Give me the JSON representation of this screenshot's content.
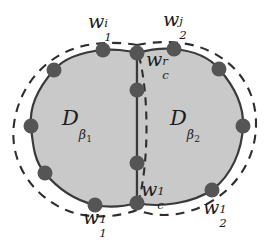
{
  "figure": {
    "background_color": "#ffffff",
    "fill_color": "#c9c9c9",
    "outline_color": "#3a3a3a",
    "dashed_color": "#2e2e2e",
    "dot_color": "#555555",
    "text_color": "#1c1c1c",
    "width": 269,
    "height": 244
  },
  "labels": {
    "top_left": {
      "base": "w",
      "sub": "1",
      "sup": "i",
      "x": 88,
      "y": 12
    },
    "top_right": {
      "base": "w",
      "sub": "2",
      "sup": "j",
      "x": 163,
      "y": 10
    },
    "center_top": {
      "base": "w",
      "sub": "c",
      "sup": "r",
      "x": 146,
      "y": 50
    },
    "center_bottom": {
      "base": "w",
      "sub": "c",
      "sup": "1",
      "x": 141,
      "y": 180
    },
    "bottom_left": {
      "base": "w",
      "sub": "1",
      "sup": "1",
      "x": 83,
      "y": 208
    },
    "bottom_right": {
      "base": "w",
      "sub": "2",
      "sup": "1",
      "x": 203,
      "y": 198
    }
  },
  "regions": {
    "left": {
      "symbol": "D",
      "beta": "β",
      "index": "1",
      "x": 62,
      "y": 108
    },
    "right": {
      "symbol": "D",
      "beta": "β",
      "index": "2",
      "x": 170,
      "y": 108
    }
  },
  "geometry": {
    "left_lobe_center_x": 83,
    "right_lobe_center_x": 172,
    "lobe_center_y": 124,
    "lobe_radius_x": 72,
    "lobe_radius_y": 75,
    "divider_x": 137,
    "dashed_offset": 7
  },
  "boundary_dots": [
    {
      "name": "dot-left-top-outer",
      "x": 103,
      "y": 50
    },
    {
      "name": "dot-left-upper",
      "x": 54,
      "y": 70
    },
    {
      "name": "dot-left-mid",
      "x": 31,
      "y": 126
    },
    {
      "name": "dot-left-lower",
      "x": 45,
      "y": 173
    },
    {
      "name": "dot-left-bottom",
      "x": 95,
      "y": 205
    },
    {
      "name": "dot-center-top",
      "x": 137,
      "y": 53
    },
    {
      "name": "dot-center-upper-mid",
      "x": 137,
      "y": 90
    },
    {
      "name": "dot-center-lower-mid",
      "x": 137,
      "y": 163
    },
    {
      "name": "dot-center-bottom",
      "x": 137,
      "y": 203
    },
    {
      "name": "dot-right-top-outer",
      "x": 174,
      "y": 49
    },
    {
      "name": "dot-right-upper",
      "x": 219,
      "y": 69
    },
    {
      "name": "dot-right-mid",
      "x": 243,
      "y": 126
    },
    {
      "name": "dot-right-lower",
      "x": 212,
      "y": 190
    }
  ]
}
